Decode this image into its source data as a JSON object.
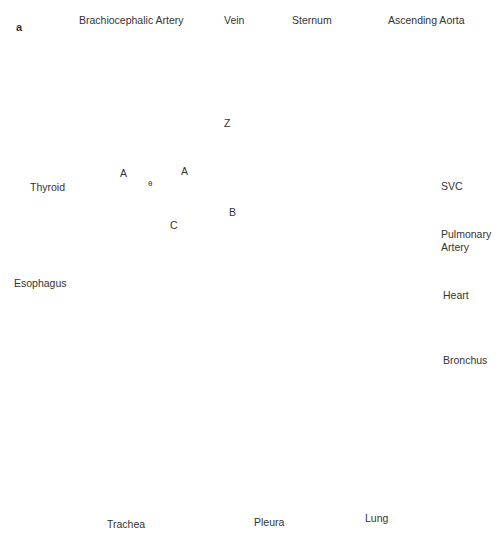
{
  "figure": {
    "panel_label": "a",
    "type": "anatomical cross-section diagram"
  },
  "labels": {
    "brachiocephalic_artery": "Brachiocephalic Artery",
    "vein": "Vein",
    "sternum": "Sternum",
    "ascending_aorta": "Ascending Aorta",
    "thyroid": "Thyroid",
    "svc": "SVC",
    "pulmonary_artery_line1": "Pulmonary",
    "pulmonary_artery_line2": "Artery",
    "esophagus": "Esophagus",
    "heart": "Heart",
    "bronchus": "Bronchus",
    "trachea": "Trachea",
    "pleura": "Pleura",
    "lung": "Lung"
  },
  "geometry_labels": {
    "z_axis": "Z",
    "a_left": "A",
    "a_top": "A",
    "theta": "θ",
    "b": "B",
    "c": "C",
    "m": "M"
  },
  "colors": {
    "tissue_light": "#e6e6e6",
    "tissue_mid": "#b3b3b3",
    "tissue_gray": "#9a9a9a",
    "dark_gray": "#555555",
    "black": "#111111",
    "skin": "#a8a8a8"
  }
}
